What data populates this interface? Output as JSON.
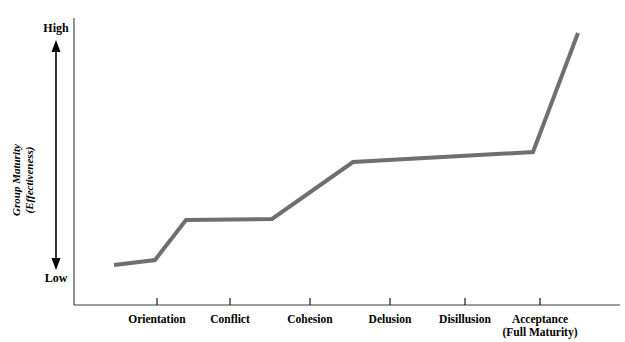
{
  "chart_data": {
    "type": "line",
    "title": "",
    "subtitle": "",
    "xlabel": "",
    "ylabel": "Group Maturity (Effectiveness)",
    "ylabel_lines": [
      "Group Maturity",
      "(Effectiveness)"
    ],
    "y_axis_top_label": "High",
    "y_axis_bottom_label": "Low",
    "categories": [
      "Orientation",
      "Conflict",
      "Cohesion",
      "Delusion",
      "Disillusion",
      "Acceptance (Full Maturity)"
    ],
    "category_lines": [
      [
        "Orientation"
      ],
      [
        "Conflict"
      ],
      [
        "Cohesion"
      ],
      [
        "Delusion"
      ],
      [
        "Disillusion"
      ],
      [
        "Acceptance",
        "(Full Maturity)"
      ]
    ],
    "x": [
      "Orientation",
      "Conflict",
      "Cohesion",
      "Delusion",
      "Disillusion",
      "Acceptance (Full Maturity)"
    ],
    "values": [
      12,
      35,
      36,
      62,
      66,
      97
    ],
    "series": [
      {
        "name": "Group Maturity",
        "values": [
          12,
          35,
          36,
          62,
          66,
          97
        ]
      }
    ],
    "ylim": [
      0,
      100
    ],
    "yticks": [
      "Low",
      "High"
    ],
    "grid": false,
    "legend": false,
    "legend_position": "none",
    "line_color": "#6f6f6f",
    "axis_color": "#000000",
    "line_width": 4,
    "annotations": [],
    "vertices_px": [
      [
        114,
        265
      ],
      [
        155,
        260
      ],
      [
        186,
        220
      ],
      [
        272,
        219
      ],
      [
        353,
        162
      ],
      [
        533,
        152
      ],
      [
        578,
        33
      ]
    ]
  },
  "axes": {
    "y_axis_x_px": 74,
    "x_axis_y_px": 305,
    "x_axis_start_px": 74,
    "x_axis_end_px": 620,
    "y_axis_top_px": 18,
    "tick_positions_px": [
      157,
      230,
      310,
      390,
      465,
      540
    ],
    "arrow_x_px": 56,
    "arrow_top_px": 45,
    "arrow_bottom_px": 265
  },
  "colors": {
    "line": "#6f6f6f",
    "axis": "#000000",
    "text": "#000000",
    "background": "#ffffff"
  }
}
